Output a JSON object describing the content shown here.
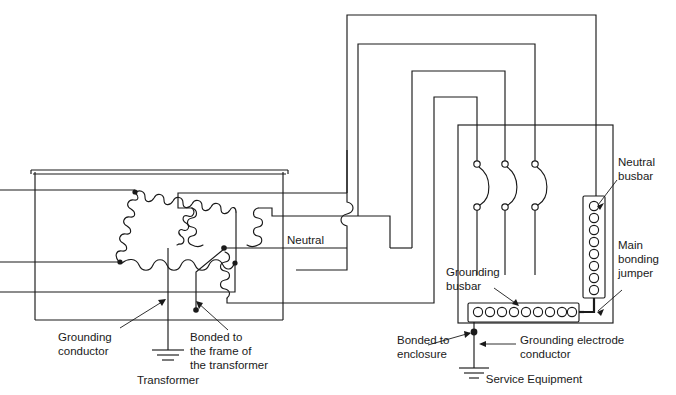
{
  "diagram": {
    "type": "electrical-wiring-schematic",
    "background_color": "#ffffff",
    "line_color": "#1a1a1a"
  },
  "labels": {
    "neutral": "Neutral",
    "grounding_conductor": "Grounding\nconductor",
    "grounding_conductor_line1": "Grounding",
    "grounding_conductor_line2": "conductor",
    "bonded_to_frame_line1": "Bonded to",
    "bonded_to_frame_line2": "the frame of",
    "bonded_to_frame_line3": "the transformer",
    "transformer": "Transformer",
    "neutral_busbar_line1": "Neutral",
    "neutral_busbar_line2": "busbar",
    "main_bonding_jumper_line1": "Main",
    "main_bonding_jumper_line2": "bonding",
    "main_bonding_jumper_line3": "jumper",
    "grounding_busbar_line1": "Grounding",
    "grounding_busbar_line2": "busbar",
    "bonded_to_enclosure_line1": "Bonded to",
    "bonded_to_enclosure_line2": "enclosure",
    "grounding_electrode_line1": "Grounding electrode",
    "grounding_electrode_line2": "conductor",
    "service_equipment": "Service Equipment"
  },
  "components": {
    "delta_winding": {
      "name": "delta-primary-winding",
      "coil_count": 3,
      "terminal_dots": 3
    },
    "wye_winding": {
      "name": "wye-secondary-winding",
      "coil_count": 3,
      "center_node": true
    },
    "neutral_busbar": {
      "name": "neutral-busbar",
      "holes": 8
    },
    "grounding_busbar": {
      "name": "grounding-busbar",
      "holes": 9
    },
    "breakers": {
      "name": "circuit-breakers",
      "count": 3
    },
    "ground_symbols": {
      "count": 3,
      "bars": 3
    },
    "wire_crossovers": {
      "count": 2,
      "style": "semicircular-hop"
    }
  }
}
